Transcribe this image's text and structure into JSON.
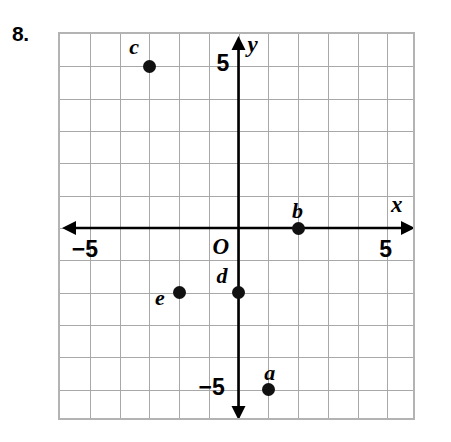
{
  "exercise": {
    "number": "8."
  },
  "chart_data": {
    "type": "scatter",
    "title": "",
    "xlabel": "x",
    "ylabel": "y",
    "xlim": [
      -6,
      6
    ],
    "ylim": [
      -6,
      6
    ],
    "grid": true,
    "grid_step": 1,
    "legend": "none",
    "origin_label": "O",
    "axis_arrows": [
      "left",
      "right",
      "up",
      "down"
    ],
    "tick_labels": [
      {
        "name": "x-negative-five",
        "text": "−5",
        "axis": "x",
        "value": -5
      },
      {
        "name": "x-positive-five",
        "text": "5",
        "axis": "x",
        "value": 5
      },
      {
        "name": "y-positive-five",
        "text": "5",
        "axis": "y",
        "value": 5
      },
      {
        "name": "y-negative-five",
        "text": "−5",
        "axis": "y",
        "value": -5
      }
    ],
    "points": [
      {
        "label": "a",
        "x": 1,
        "y": -5
      },
      {
        "label": "b",
        "x": 2,
        "y": 0
      },
      {
        "label": "c",
        "x": -3,
        "y": 5
      },
      {
        "label": "d",
        "x": 0,
        "y": -2
      },
      {
        "label": "e",
        "x": -2,
        "y": -2
      }
    ],
    "point_color": "#111111",
    "grid_color": "#a8a8a8",
    "axis_color": "#000000"
  }
}
